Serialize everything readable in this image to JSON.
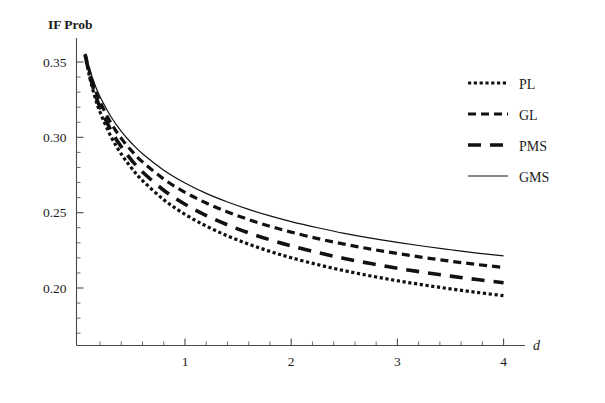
{
  "chart_data": {
    "type": "line",
    "title": "",
    "ylabel": "IF Prob",
    "xlabel": "d",
    "xlim": [
      0,
      4.15
    ],
    "ylim": [
      0.157,
      0.3585
    ],
    "grid": false,
    "legend_position": "top-right",
    "x_ticks_major": [
      1,
      2,
      3,
      4
    ],
    "x_tick_labels": [
      "1",
      "2",
      "3",
      "4"
    ],
    "x_minor_step": 0.2,
    "y_ticks_major": [
      0.2,
      0.25,
      0.3,
      0.35
    ],
    "y_tick_labels": [
      "0.20",
      "0.25",
      "0.30",
      "0.35"
    ],
    "y_minor_step": 0.01,
    "x": [
      0.06,
      0.1,
      0.15,
      0.2,
      0.3,
      0.4,
      0.5,
      0.6,
      0.8,
      1.0,
      1.2,
      1.4,
      1.6,
      1.8,
      2.0,
      2.25,
      2.5,
      2.75,
      3.0,
      3.25,
      3.5,
      3.75,
      4.0
    ],
    "series": [
      {
        "name": "PL",
        "style": "dotted",
        "values": [
          0.3545,
          0.3405,
          0.3272,
          0.3168,
          0.3009,
          0.2889,
          0.2793,
          0.2713,
          0.2586,
          0.2489,
          0.2411,
          0.2346,
          0.2291,
          0.2243,
          0.2201,
          0.2155,
          0.2115,
          0.208,
          0.2048,
          0.202,
          0.1994,
          0.1971,
          0.1949
        ]
      },
      {
        "name": "GL",
        "style": "dashed",
        "values": [
          0.3552,
          0.3438,
          0.3325,
          0.3236,
          0.3098,
          0.2993,
          0.2908,
          0.2837,
          0.2723,
          0.2635,
          0.2564,
          0.2505,
          0.2454,
          0.241,
          0.2371,
          0.2328,
          0.2291,
          0.2258,
          0.2229,
          0.2202,
          0.2178,
          0.2156,
          0.2136
        ]
      },
      {
        "name": "PMS",
        "style": "long-dashed",
        "values": [
          0.3548,
          0.342,
          0.3296,
          0.3199,
          0.305,
          0.2937,
          0.2846,
          0.277,
          0.2649,
          0.2556,
          0.2481,
          0.2419,
          0.2366,
          0.232,
          0.228,
          0.2235,
          0.2196,
          0.2162,
          0.2131,
          0.2104,
          0.2079,
          0.2056,
          0.2035
        ]
      },
      {
        "name": "GMS",
        "style": "solid",
        "values": [
          0.3556,
          0.3455,
          0.3352,
          0.3269,
          0.314,
          0.304,
          0.2959,
          0.2891,
          0.2782,
          0.2697,
          0.2628,
          0.2571,
          0.2522,
          0.2479,
          0.2441,
          0.24,
          0.2363,
          0.2331,
          0.2303,
          0.2277,
          0.2254,
          0.2232,
          0.2213
        ]
      }
    ]
  },
  "legend": {
    "items": [
      {
        "label": "PL",
        "style": "dotted"
      },
      {
        "label": "GL",
        "style": "dashed"
      },
      {
        "label": "PMS",
        "style": "long-dashed"
      },
      {
        "label": "GMS",
        "style": "solid"
      }
    ]
  },
  "axes": {
    "y_title": "IF Prob",
    "x_title": "d"
  }
}
